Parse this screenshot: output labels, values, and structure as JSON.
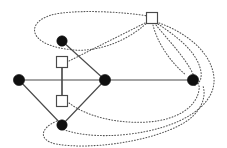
{
  "figure": {
    "width": 227,
    "height": 148,
    "background_color": "#ffffff"
  },
  "style": {
    "solid_edge_color": "#4a4a4a",
    "dotted_edge_color": "#555555",
    "circle_node_fill": "#101010",
    "square_node_fill": "#ffffff",
    "square_node_stroke": "#4a4a4a"
  },
  "chart_data": {
    "type": "diagram",
    "nodes": [
      {
        "id": "c-top",
        "shape": "circle",
        "filled": true,
        "x": 62,
        "y": 41,
        "r": 5.2
      },
      {
        "id": "s-upper",
        "shape": "square",
        "filled": false,
        "x": 62,
        "y": 62,
        "size": 11
      },
      {
        "id": "c-left",
        "shape": "circle",
        "filled": true,
        "x": 19,
        "y": 80,
        "r": 5.6
      },
      {
        "id": "c-center",
        "shape": "circle",
        "filled": true,
        "x": 105,
        "y": 80,
        "r": 5.6
      },
      {
        "id": "s-lower",
        "shape": "square",
        "filled": false,
        "x": 62,
        "y": 101,
        "size": 11
      },
      {
        "id": "c-bottom",
        "shape": "circle",
        "filled": true,
        "x": 62,
        "y": 125,
        "r": 5.2
      },
      {
        "id": "s-topright",
        "shape": "square",
        "filled": false,
        "x": 152,
        "y": 18,
        "size": 11
      },
      {
        "id": "c-right",
        "shape": "circle",
        "filled": true,
        "x": 193,
        "y": 80,
        "r": 5.6
      }
    ],
    "solid_edges": [
      {
        "from": "c-left",
        "to": "c-top"
      },
      {
        "from": "c-top",
        "to": "c-center"
      },
      {
        "from": "c-left",
        "to": "c-bottom"
      },
      {
        "from": "c-bottom",
        "to": "c-center"
      },
      {
        "from": "c-left",
        "to": "c-center"
      },
      {
        "from": "c-center",
        "to": "c-right"
      },
      {
        "from": "s-upper",
        "to": "s-lower"
      }
    ],
    "dotted_edges": [
      {
        "from": "s-topright",
        "to": "c-top",
        "style": "large-loop-ellipse"
      },
      {
        "from": "s-upper",
        "to": "s-topright",
        "style": "straight"
      },
      {
        "from": "s-topright",
        "to": "c-right",
        "style": "arc-inner"
      },
      {
        "from": "s-topright",
        "to": "c-right",
        "style": "arc-mid"
      },
      {
        "from": "s-topright",
        "to": "c-right",
        "style": "arc-outer"
      },
      {
        "from": "s-topright",
        "to": "c-bottom",
        "style": "arc-sweep-right"
      },
      {
        "from": "s-lower",
        "to": "c-right",
        "style": "arc-low"
      },
      {
        "from": "c-bottom",
        "to": "c-right",
        "style": "arc-bottom-outer"
      }
    ],
    "node_count": 8,
    "solid_edge_count": 7,
    "dotted_edge_count": 8,
    "legend": []
  }
}
